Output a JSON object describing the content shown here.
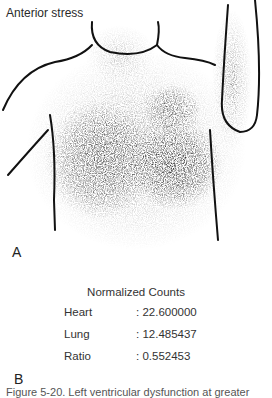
{
  "panel_a": {
    "title": "Anterior stress",
    "label": "A",
    "regions_of_interest": [
      "lung-roi",
      "heart-roi"
    ]
  },
  "panel_b": {
    "title": "Normalized Counts",
    "label": "B",
    "rows": [
      {
        "key": "Heart",
        "value": ": 22.600000"
      },
      {
        "key": "Lung",
        "value": ": 12.485437"
      },
      {
        "key": "Ratio",
        "value": ": 0.552453"
      }
    ]
  },
  "caption": "Figure 5-20. Left ventricular dysfunction at greater"
}
